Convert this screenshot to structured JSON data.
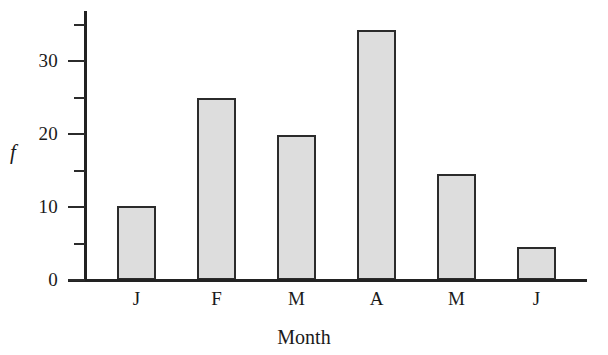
{
  "chart_data": {
    "type": "bar",
    "title": "",
    "xlabel": "Month",
    "ylabel": "f",
    "categories": [
      "J",
      "F",
      "M",
      "A",
      "M",
      "J"
    ],
    "values": [
      10.2,
      24.9,
      19.8,
      34.2,
      14.5,
      4.5
    ],
    "ylim": [
      0,
      36
    ],
    "xlim": [
      0,
      6
    ],
    "y_major_ticks": [
      0,
      10,
      20,
      30
    ],
    "y_minor_ticks": [
      5,
      15,
      25,
      35
    ],
    "y_tick_labels": [
      "0",
      "10",
      "20",
      "30"
    ],
    "grid": false,
    "legend": false,
    "legend_position": "none",
    "bar_fill_color": "#dddddd",
    "bar_edge_color": "#2b2b2b",
    "axis_color": "#222222",
    "background_color": "#ffffff"
  },
  "axis": {
    "y_label": "f",
    "x_label": "Month"
  },
  "y_ticks": [
    {
      "label": "30",
      "value": 30
    },
    {
      "label": "20",
      "value": 20
    },
    {
      "label": "10",
      "value": 10
    },
    {
      "label": "0",
      "value": 0
    }
  ],
  "x_ticks": [
    {
      "label": "J"
    },
    {
      "label": "F"
    },
    {
      "label": "M"
    },
    {
      "label": "A"
    },
    {
      "label": "M"
    },
    {
      "label": "J"
    }
  ]
}
